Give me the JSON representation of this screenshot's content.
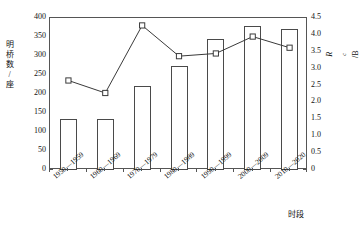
{
  "chart_data": {
    "type": "bar",
    "title": "",
    "xlabel": "时段",
    "ylabel": "明桥数/座",
    "y2label": "R_c/B",
    "ylim": [
      0,
      400
    ],
    "y2lim": [
      0,
      4.5
    ],
    "grid": false,
    "legend": "none",
    "categories": [
      "1950—1959",
      "1960—1969",
      "1970—1979",
      "1980—1989",
      "1990—1999",
      "2000—2009",
      "2010—2020"
    ],
    "yticks": [
      "0",
      "50",
      "100",
      "150",
      "200",
      "250",
      "300",
      "350",
      "400"
    ],
    "ytick_values": [
      0,
      50,
      100,
      150,
      200,
      250,
      300,
      350,
      400
    ],
    "y2ticks": [
      "0",
      "0.5",
      "1.0",
      "1.5",
      "2.0",
      "2.5",
      "3.0",
      "3.5",
      "4.0",
      "4.5"
    ],
    "y2tick_values": [
      0,
      0.5,
      1.0,
      1.5,
      2.0,
      2.5,
      3.0,
      3.5,
      4.0,
      4.5
    ],
    "series": [
      {
        "name": "明桥数/座",
        "type": "bar",
        "axis": "left",
        "values": [
          135,
          135,
          222,
          275,
          345,
          378,
          370
        ]
      },
      {
        "name": "R_c/B",
        "type": "line",
        "axis": "right",
        "values": [
          2.65,
          2.28,
          4.28,
          3.37,
          3.45,
          3.95,
          3.62
        ]
      }
    ]
  },
  "axis": {
    "x_title": "时段",
    "y_left_chars": [
      "明",
      "桥",
      "数",
      "/",
      "座"
    ],
    "y_right_main": "R",
    "y_right_sub": "c",
    "y_right_unit": "/B"
  },
  "colors": {
    "frame": "#555555",
    "bar_stroke": "#4a4a4a",
    "bar_fill": "#ffffff",
    "line": "#3a3a3a",
    "marker_fill": "#ffffff",
    "text": "#111111",
    "background": "#ffffff"
  }
}
